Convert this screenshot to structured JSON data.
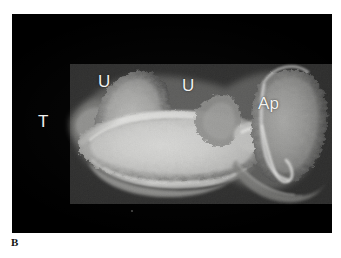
{
  "figure": {
    "panel_letter": "B",
    "modality": "radiograph",
    "background_color": "#ffffff",
    "film_color": "#000000",
    "annotation_color": "#f2f2f0",
    "panel": {
      "x": 12,
      "y": 14,
      "width": 320,
      "height": 219
    }
  },
  "annotations": [
    {
      "id": "T",
      "label": "T",
      "meaning": "tuber",
      "x": 26,
      "y": 99
    },
    {
      "id": "U1",
      "label": "U",
      "meaning": "uncinate",
      "x": 86,
      "y": 59
    },
    {
      "id": "U2",
      "label": "U",
      "meaning": "uncinate",
      "x": 170,
      "y": 63
    },
    {
      "id": "Ap",
      "label": "Ap",
      "meaning": "apophysis",
      "x": 246,
      "y": 81
    }
  ],
  "specimen": {
    "description": "lateral radiograph of an elongate bone specimen with a dense central shaft, two dorsal projections and a trabecular expansion at the right end",
    "bright_core": "#e8e8e6",
    "mid_tone": "#8d8d8b",
    "faint_tone": "#4a4a49"
  }
}
